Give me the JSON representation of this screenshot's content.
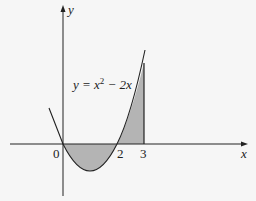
{
  "diagram": {
    "type": "function-graph",
    "function_label": "y = x² − 2x",
    "function_label_parts": {
      "lhs": "y",
      "eq": " = x",
      "sup": "2",
      "rest": " − 2x"
    },
    "axes": {
      "x_label": "x",
      "y_label": "y"
    },
    "ticks": {
      "origin": "0",
      "two": "2",
      "three": "3"
    },
    "shaded_regions": [
      {
        "from": 0,
        "to": 2,
        "description": "below x-axis"
      },
      {
        "from": 2,
        "to": 3,
        "description": "above x-axis"
      }
    ],
    "colors": {
      "shade": "#b4b4b4",
      "line": "#222222",
      "background": "#f6f6f6"
    }
  }
}
